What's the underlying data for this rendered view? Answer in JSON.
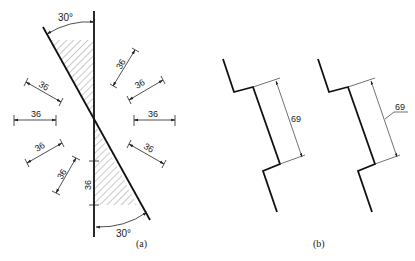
{
  "figure_a": {
    "caption": "(a)",
    "top_angle": "30°",
    "bottom_angle": "30°",
    "dimensions": [
      "36",
      "36",
      "36",
      "36",
      "36",
      "36",
      "36",
      "36",
      "36"
    ]
  },
  "figure_b": {
    "caption": "(b)",
    "left_dimension": "69",
    "right_dimension": "69"
  },
  "colors": {
    "line": "#111111",
    "thin": "#333333",
    "hatch": "#555555"
  }
}
